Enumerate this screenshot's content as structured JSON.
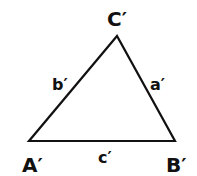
{
  "diagram": {
    "type": "triangle",
    "vertices": [
      {
        "id": "A",
        "label": "A′",
        "x": 29,
        "y": 141
      },
      {
        "id": "B",
        "label": "B′",
        "x": 175,
        "y": 141
      },
      {
        "id": "C",
        "label": "C′",
        "x": 117,
        "y": 36
      }
    ],
    "sides": [
      {
        "id": "a",
        "label": "a′",
        "between": "B-C"
      },
      {
        "id": "b",
        "label": "b′",
        "between": "A-C"
      },
      {
        "id": "c",
        "label": "c′",
        "between": "A-B"
      }
    ],
    "stroke_color": "#111111",
    "background": "#ffffff"
  }
}
